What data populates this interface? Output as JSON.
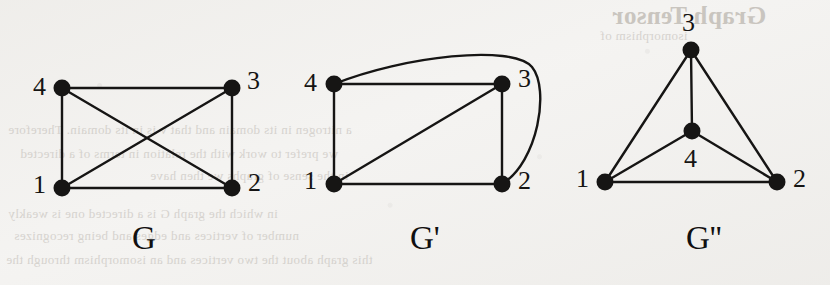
{
  "figure": {
    "background_color": "#f4f3f1",
    "ink_color": "#161514",
    "graphs": [
      {
        "id": "G",
        "caption": "G",
        "caption_pos": {
          "x": 132,
          "y": 222
        },
        "nodes": [
          {
            "id": "4",
            "label": "4",
            "x": 62,
            "y": 88,
            "label_x": 33,
            "label_y": 74
          },
          {
            "id": "3",
            "label": "3",
            "x": 232,
            "y": 88,
            "label_x": 247,
            "label_y": 68
          },
          {
            "id": "1",
            "label": "1",
            "x": 62,
            "y": 188,
            "label_x": 33,
            "label_y": 172
          },
          {
            "id": "2",
            "label": "2",
            "x": 232,
            "y": 188,
            "label_x": 248,
            "label_y": 170
          }
        ],
        "edges": [
          {
            "from": "4",
            "to": "3",
            "type": "line"
          },
          {
            "from": "4",
            "to": "1",
            "type": "line"
          },
          {
            "from": "1",
            "to": "2",
            "type": "line"
          },
          {
            "from": "3",
            "to": "2",
            "type": "line"
          },
          {
            "from": "4",
            "to": "2",
            "type": "line"
          },
          {
            "from": "1",
            "to": "3",
            "type": "line"
          }
        ]
      },
      {
        "id": "G-prime",
        "caption": "G'",
        "caption_pos": {
          "x": 410,
          "y": 222
        },
        "nodes": [
          {
            "id": "4",
            "label": "4",
            "x": 334,
            "y": 84,
            "label_x": 304,
            "label_y": 70
          },
          {
            "id": "3",
            "label": "3",
            "x": 502,
            "y": 84,
            "label_x": 518,
            "label_y": 66
          },
          {
            "id": "1",
            "label": "1",
            "x": 334,
            "y": 184,
            "label_x": 304,
            "label_y": 168
          },
          {
            "id": "2",
            "label": "2",
            "x": 502,
            "y": 184,
            "label_x": 518,
            "label_y": 168
          }
        ],
        "edges": [
          {
            "from": "4",
            "to": "3",
            "type": "line"
          },
          {
            "from": "4",
            "to": "1",
            "type": "line"
          },
          {
            "from": "1",
            "to": "2",
            "type": "line"
          },
          {
            "from": "3",
            "to": "2",
            "type": "line"
          },
          {
            "from": "1",
            "to": "3",
            "type": "line"
          },
          {
            "from": "4",
            "to": "2",
            "type": "curve",
            "note": "arcs over the top and around the right side"
          }
        ]
      },
      {
        "id": "G-double-prime",
        "caption": "G''",
        "caption_pos": {
          "x": 686,
          "y": 222
        },
        "nodes": [
          {
            "id": "3",
            "label": "3",
            "x": 691,
            "y": 50,
            "label_x": 682,
            "label_y": 10
          },
          {
            "id": "4",
            "label": "4",
            "x": 692,
            "y": 131,
            "label_x": 684,
            "label_y": 146
          },
          {
            "id": "1",
            "label": "1",
            "x": 605,
            "y": 182,
            "label_x": 576,
            "label_y": 166
          },
          {
            "id": "2",
            "label": "2",
            "x": 777,
            "y": 182,
            "label_x": 793,
            "label_y": 166
          }
        ],
        "edges": [
          {
            "from": "3",
            "to": "1",
            "type": "line"
          },
          {
            "from": "3",
            "to": "2",
            "type": "line"
          },
          {
            "from": "3",
            "to": "4",
            "type": "line"
          },
          {
            "from": "4",
            "to": "1",
            "type": "line"
          },
          {
            "from": "4",
            "to": "2",
            "type": "line"
          },
          {
            "from": "1",
            "to": "2",
            "type": "line"
          }
        ]
      }
    ],
    "bleed_through": {
      "note": "faint mirrored text showing through from the reverse side of the page",
      "lines": [
        {
          "text": "Graph Tensor",
          "x": 612,
          "y": 2,
          "size": 25,
          "bold": true
        },
        {
          "text": "isomorphism of",
          "x": 600,
          "y": 28,
          "size": 13,
          "bold": false
        },
        {
          "text": "a nitrogen in its domain and that v is in its domain. Therefore",
          "x": 8,
          "y": 122,
          "size": 13,
          "bold": false
        },
        {
          "text": "we prefer to work with the relation in terms of a directed",
          "x": 20,
          "y": 146,
          "size": 13,
          "bold": false
        },
        {
          "text": "in the sense of graphs we then have",
          "x": 150,
          "y": 168,
          "size": 13,
          "bold": false
        },
        {
          "text": "in which the graph G is a directed one is weakly",
          "x": 8,
          "y": 206,
          "size": 13,
          "bold": false
        },
        {
          "text": "number of vertices and edges and being recognizes",
          "x": 14,
          "y": 228,
          "size": 13,
          "bold": false
        },
        {
          "text": "this graph about the two vertices and an isomorphism through the",
          "x": 6,
          "y": 252,
          "size": 13,
          "bold": false
        }
      ]
    }
  }
}
